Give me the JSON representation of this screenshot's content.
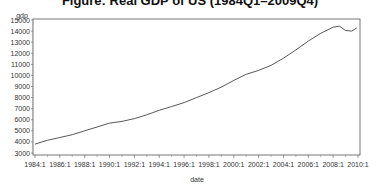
{
  "chart_data": {
    "type": "line",
    "title": "Figure: Real GDP of US (1984Q1–2009Q4)",
    "xlabel": "date",
    "ylabel": "gdp",
    "ylim": [
      3000,
      15000
    ],
    "xlim": [
      "1984:1",
      "2010:1"
    ],
    "grid": false,
    "legend": null,
    "x_ticks": [
      "1984:1",
      "1986:1",
      "1988:1",
      "1990:1",
      "1992:1",
      "1994:1",
      "1996:1",
      "1998:1",
      "2000:1",
      "2002:1",
      "2004:1",
      "2006:1",
      "2008:1",
      "2010:1"
    ],
    "y_ticks": [
      3000,
      4000,
      5000,
      6000,
      7000,
      8000,
      9000,
      10000,
      11000,
      12000,
      13000,
      14000,
      15000
    ],
    "series": [
      {
        "name": "gdp",
        "color": "#444444",
        "x": [
          1984.0,
          1985.0,
          1986.0,
          1987.0,
          1988.0,
          1989.0,
          1990.0,
          1991.0,
          1992.0,
          1993.0,
          1994.0,
          1995.0,
          1996.0,
          1997.0,
          1998.0,
          1999.0,
          2000.0,
          2001.0,
          2002.0,
          2003.0,
          2004.0,
          2005.0,
          2006.0,
          2007.0,
          2008.0,
          2008.5,
          2009.0,
          2009.5,
          2009.9
        ],
        "values": [
          3800,
          4150,
          4400,
          4650,
          5000,
          5350,
          5700,
          5850,
          6100,
          6450,
          6850,
          7200,
          7550,
          8000,
          8450,
          8950,
          9550,
          10100,
          10450,
          10900,
          11550,
          12300,
          13100,
          13800,
          14350,
          14450,
          14050,
          14000,
          14300
        ]
      }
    ]
  }
}
